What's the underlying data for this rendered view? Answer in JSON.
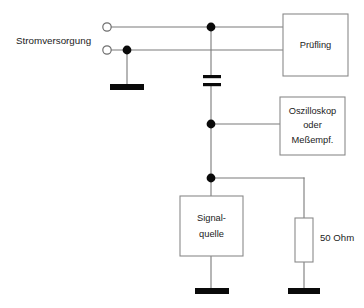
{
  "diagram": {
    "labels": {
      "power_supply": "Stromversorgung",
      "device_under_test": "Prüfling",
      "scope_line1": "Oszilloskop",
      "scope_line2": "oder",
      "scope_line3": "Meßempf.",
      "source_line1": "Signal-",
      "source_line2": "quelle",
      "resistor": "50 Ohm"
    },
    "components": {
      "dut_box": {
        "name": "Prüfling",
        "x": 283,
        "y": 14,
        "w": 65,
        "h": 62
      },
      "scope_box": {
        "name": "Oszilloskop oder Meßempf.",
        "x": 280,
        "y": 97,
        "w": 65,
        "h": 58
      },
      "source_box": {
        "name": "Signal-quelle",
        "x": 180,
        "y": 196,
        "w": 63,
        "h": 60
      },
      "resistor_box": {
        "name": "50 Ohm",
        "x": 295,
        "y": 218,
        "w": 18,
        "h": 44
      },
      "capacitor": {
        "name": "Kondensator",
        "x": 203,
        "y": 76,
        "w": 18,
        "plate_gap": 8
      }
    },
    "terminals": [
      {
        "name": "supply-terminal-top",
        "cx": 107,
        "cy": 27,
        "r": 4.2
      },
      {
        "name": "supply-terminal-bottom",
        "cx": 107,
        "cy": 50,
        "r": 4.2
      }
    ],
    "junctions": [
      {
        "name": "junction-top-rail",
        "cx": 211,
        "cy": 27,
        "r": 4.4
      },
      {
        "name": "junction-supply-ground",
        "cx": 127,
        "cy": 50,
        "r": 4.4
      },
      {
        "name": "junction-scope-tap",
        "cx": 211,
        "cy": 124,
        "r": 4.4
      },
      {
        "name": "junction-source-tap",
        "cx": 211,
        "cy": 178,
        "r": 4.4
      }
    ],
    "grounds": [
      {
        "name": "ground-supply",
        "x": 110,
        "y": 84,
        "w": 34,
        "h": 6
      },
      {
        "name": "ground-source",
        "x": 195,
        "y": 288,
        "w": 34,
        "h": 6
      },
      {
        "name": "ground-resistor",
        "x": 288,
        "y": 288,
        "w": 32,
        "h": 6
      }
    ],
    "colors": {
      "wire": "#7a7a7a",
      "box_border": "#8a8a8a",
      "node": "#0a0a0a",
      "background": "#ffffff",
      "text": "#1b1b1b"
    }
  }
}
